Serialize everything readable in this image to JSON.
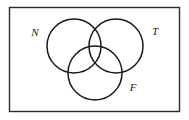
{
  "figure": {
    "type": "venn-diagram",
    "set_count": 3,
    "background_color": "#ffffff",
    "stroke_color": "#1a1a1a"
  },
  "universe_frame": {
    "name": "universal-set-rectangle",
    "x": 9.5,
    "y": 7.5,
    "width": 170,
    "height": 104,
    "stroke_color": "#2b2b2b",
    "stroke_width": 1.4,
    "fill": "#ffffff"
  },
  "circles": [
    {
      "id": "N",
      "label": "N",
      "cx": 74,
      "cy": 46,
      "r": 27,
      "stroke_color": "#1a1a1a",
      "stroke_width": 1.5,
      "fill": "none"
    },
    {
      "id": "T",
      "label": "T",
      "cx": 116,
      "cy": 46,
      "r": 27,
      "stroke_color": "#1a1a1a",
      "stroke_width": 1.5,
      "fill": "none"
    },
    {
      "id": "F",
      "label": "F",
      "cx": 95,
      "cy": 73,
      "r": 27,
      "stroke_color": "#1a1a1a",
      "stroke_width": 1.5,
      "fill": "none"
    }
  ],
  "labels": {
    "n": {
      "text": "N",
      "x": 35,
      "y": 33
    },
    "t": {
      "text": "T",
      "x": 155,
      "y": 32
    },
    "f": {
      "text": "F",
      "x": 133,
      "y": 88
    }
  }
}
